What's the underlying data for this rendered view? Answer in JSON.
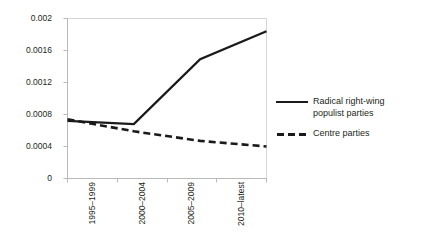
{
  "chart_data": {
    "type": "line",
    "title": "",
    "xlabel": "",
    "ylabel": "",
    "categories": [
      "1995–1999",
      "2000–2004",
      "2005–2009",
      "2010–latest"
    ],
    "yticks": [
      "0",
      "0.0004",
      "0.0008",
      "0.0012",
      "0.0016",
      "0.002"
    ],
    "ylim": [
      0,
      0.002
    ],
    "grid": false,
    "legend_position": "right",
    "series": [
      {
        "name": "Radical right-wing populist parties",
        "style": "solid",
        "color": "#1a1a1a",
        "values": [
          0.00072,
          0.00068,
          0.00149,
          0.00184
        ]
      },
      {
        "name": "Centre parties",
        "style": "dashed",
        "color": "#1a1a1a",
        "values": [
          0.00074,
          0.00059,
          0.00047,
          0.0004
        ]
      }
    ]
  },
  "legend": {
    "items": [
      {
        "label_line1": "Radical right-wing",
        "label_line2": "populist parties",
        "style": "solid"
      },
      {
        "label_line1": "Centre parties",
        "label_line2": "",
        "style": "dashed"
      }
    ]
  }
}
